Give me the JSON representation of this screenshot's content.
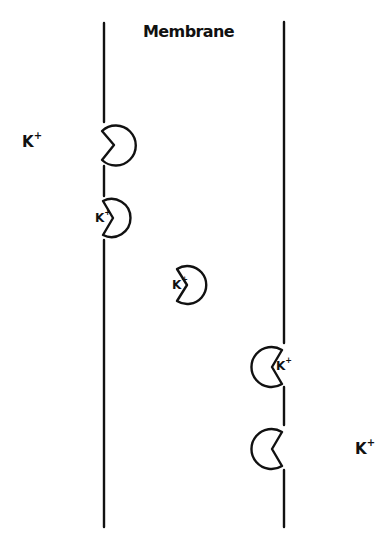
{
  "diagram": {
    "title": "Membrane",
    "ion_symbol": "K",
    "ion_charge": "+",
    "colors": {
      "stroke": "#111111",
      "background": "#ffffff"
    },
    "membrane": {
      "left_boundary_x": 104,
      "right_boundary_x": 284,
      "top_y": 22,
      "bottom_y": 527
    },
    "free_ions": [
      {
        "side": "left",
        "label": "K",
        "charge": "+",
        "x": 22,
        "y": 133
      },
      {
        "side": "right",
        "label": "K",
        "charge": "+",
        "x": 355,
        "y": 440
      }
    ],
    "carriers": [
      {
        "step": 1,
        "position": "left interface",
        "mouth_facing": "left",
        "bound_ion": false
      },
      {
        "step": 2,
        "position": "left interface",
        "mouth_facing": "left",
        "bound_ion": true,
        "ion_label": "K",
        "ion_charge": "+"
      },
      {
        "step": 3,
        "position": "membrane interior",
        "mouth_facing": "left",
        "bound_ion": true,
        "ion_label": "K",
        "ion_charge": "+"
      },
      {
        "step": 4,
        "position": "right interface",
        "mouth_facing": "right",
        "bound_ion": true,
        "ion_label": "K",
        "ion_charge": "+"
      },
      {
        "step": 5,
        "position": "right interface",
        "mouth_facing": "right",
        "bound_ion": false
      }
    ]
  }
}
